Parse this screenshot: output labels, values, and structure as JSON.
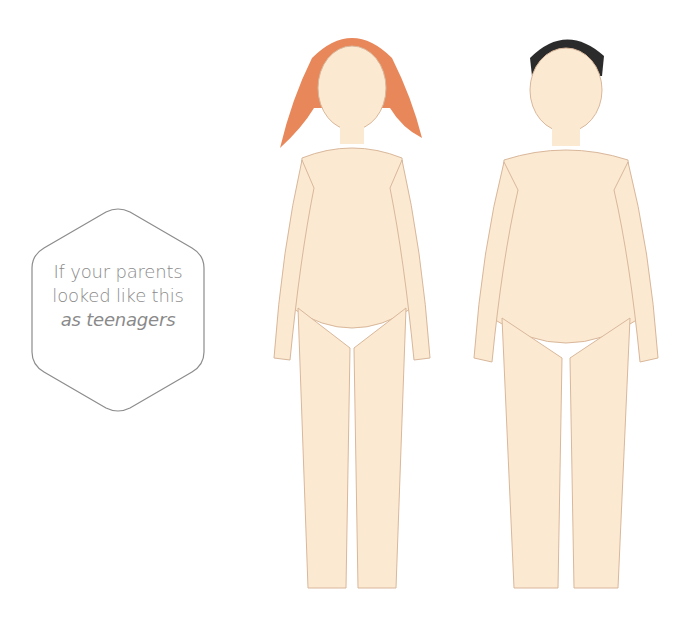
{
  "label": {
    "line1": "If your parents",
    "line2": "looked like this",
    "line3": "as teenagers"
  },
  "figures": [
    {
      "name": "teenage-mother-illustration",
      "hair_color": "#e8875a",
      "skin_color": "#fbe9d2",
      "outline_color": "#d9b79a"
    },
    {
      "name": "teenage-father-illustration",
      "hair_color": "#2b2b2b",
      "skin_color": "#fbe9d2",
      "outline_color": "#d9b79a"
    }
  ],
  "colors": {
    "background": "#ffffff",
    "label_text": "#8a8a8a",
    "hex_outline": "#8c8c8c"
  }
}
